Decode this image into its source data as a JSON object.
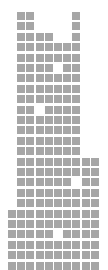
{
  "grid": {
    "cell_color": "#a6a6a6",
    "background": "#ffffff",
    "origin_x": 8,
    "origin_y": 12,
    "col_pitch": 9.2,
    "row_pitch": 10.4,
    "cell_size": 8,
    "rows": [
      [
        1,
        2,
        7
      ],
      [
        1,
        2,
        7
      ],
      [
        1,
        2,
        3,
        4,
        7
      ],
      [
        1,
        2,
        3,
        4,
        5,
        6,
        7
      ],
      [
        1,
        2,
        3,
        4,
        5,
        6,
        7
      ],
      [
        1,
        2,
        3,
        4,
        6,
        7
      ],
      [
        1,
        2,
        3,
        4,
        5,
        6,
        7
      ],
      [
        1,
        2,
        3,
        4,
        5,
        6,
        7
      ],
      [
        1,
        2,
        3,
        4,
        5,
        6,
        7
      ],
      [
        1,
        2,
        4,
        5,
        6,
        7
      ],
      [
        1,
        2,
        3,
        4,
        5,
        6,
        7
      ],
      [
        1,
        2,
        3,
        4,
        5,
        6,
        7
      ],
      [
        1,
        2,
        3,
        4,
        5,
        6,
        7
      ],
      [
        1,
        2,
        3,
        4,
        5,
        6,
        7
      ],
      [
        1,
        2,
        3,
        4,
        5,
        6,
        7,
        8,
        9
      ],
      [
        1,
        2,
        3,
        4,
        5,
        6,
        7,
        8,
        9
      ],
      [
        1,
        2,
        3,
        4,
        5,
        6,
        8,
        9
      ],
      [
        1,
        2,
        3,
        4,
        5,
        6,
        7,
        8,
        9
      ],
      [
        1,
        2,
        3,
        4,
        5,
        6,
        7,
        8,
        9
      ],
      [
        0,
        1,
        2,
        3,
        4,
        5,
        6,
        7,
        8,
        9
      ],
      [
        0,
        1,
        2,
        3,
        4,
        5,
        6,
        7,
        8,
        9
      ],
      [
        0,
        1,
        2,
        3,
        4,
        6,
        7,
        8,
        9
      ],
      [
        0,
        1,
        2,
        3,
        4,
        5,
        6,
        7,
        8,
        9
      ],
      [
        0,
        1,
        2,
        3,
        4,
        5,
        6,
        7,
        8,
        9
      ],
      [
        0,
        1,
        2,
        3,
        4,
        5,
        6,
        7,
        8,
        9
      ]
    ]
  }
}
